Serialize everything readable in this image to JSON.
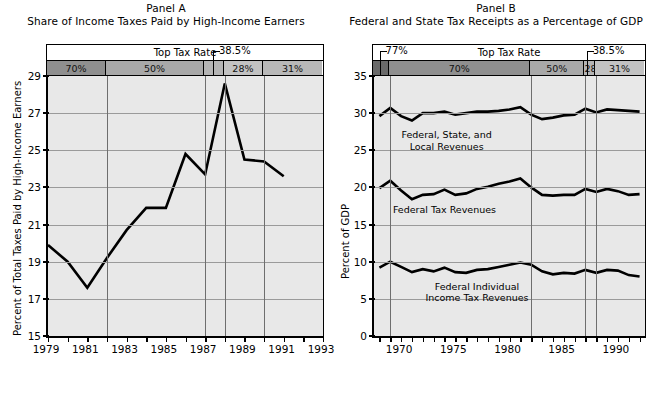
{
  "figure": {
    "panelA": {
      "title": "Panel A",
      "subtitle": "Share of Income Taxes Paid by High-Income Earners",
      "rate_header_label": "Top Tax Rate",
      "callout": "38.5%",
      "ylabel": "Percent of Total Taxes Paid by High-Income Earners",
      "bands": [
        {
          "label": "70%",
          "start": 1979,
          "end": 1982,
          "shade": "#8f8f8f"
        },
        {
          "label": "50%",
          "start": 1982,
          "end": 1987,
          "shade": "#a8a8a8"
        },
        {
          "label": "",
          "start": 1987,
          "end": 1988,
          "shade": "#b4b4b4"
        },
        {
          "label": "28%",
          "start": 1988,
          "end": 1990,
          "shade": "#c2c2c2"
        },
        {
          "label": "31%",
          "start": 1990,
          "end": 1993,
          "shade": "#b8b8b8"
        }
      ],
      "ytick_labels": [
        "29",
        "27",
        "25",
        "23",
        "21",
        "19",
        "17",
        "15"
      ],
      "xtick_labels": [
        "1979",
        "1981",
        "1983",
        "1985",
        "1987",
        "1989",
        "1991",
        "1993"
      ]
    },
    "panelB": {
      "title": "Panel B",
      "subtitle": "Federal and State Tax Receipts as a Percentage of GDP",
      "rate_header_label": "Top Tax Rate",
      "callout_left": "77%",
      "callout_right": "38.5%",
      "ylabel": "Percent of GDP",
      "bands": [
        {
          "label": "",
          "start": 1967.5,
          "end": 1969,
          "shade": "#6a6a6a"
        },
        {
          "label": "70%",
          "start": 1969,
          "end": 1982,
          "shade": "#8f8f8f"
        },
        {
          "label": "50%",
          "start": 1982,
          "end": 1987,
          "shade": "#a8a8a8"
        },
        {
          "label": "28%",
          "start": 1987,
          "end": 1988,
          "shade": "#b4b4b4"
        },
        {
          "label": "31%",
          "start": 1988,
          "end": 1992.5,
          "shade": "#c2c2c2"
        }
      ],
      "ytick_labels": [
        "35",
        "30",
        "25",
        "20",
        "15",
        "10",
        "5",
        "0"
      ],
      "xtick_labels": [
        "1970",
        "1975",
        "1980",
        "1985",
        "1990"
      ],
      "series_labels": [
        "Federal, State, and\nLocal Revenues",
        "Federal Tax Revenues",
        "Federal Individual\nIncome Tax Revenues"
      ]
    }
  },
  "chart_data": [
    {
      "type": "line",
      "title": "Panel A — Share of Income Taxes Paid by High-Income Earners",
      "xlabel": "",
      "ylabel": "Percent of Total Taxes Paid by High-Income Earners",
      "xlim": [
        1979,
        1993
      ],
      "ylim": [
        15,
        29
      ],
      "grid": true,
      "legend": "none",
      "x": [
        1979,
        1980,
        1981,
        1982,
        1983,
        1984,
        1985,
        1986,
        1987,
        1988,
        1989,
        1990,
        1991
      ],
      "series": [
        {
          "name": "Share of income taxes paid by high-income earners",
          "values": [
            19.9,
            19.0,
            17.6,
            19.2,
            20.7,
            21.9,
            21.9,
            24.8,
            23.7,
            28.6,
            24.5,
            24.4,
            23.6
          ]
        }
      ],
      "annotations": [
        {
          "text": "Top Tax Rate",
          "type": "band-header"
        },
        {
          "text": "70%",
          "type": "band",
          "span": [
            1979,
            1982
          ]
        },
        {
          "text": "50%",
          "type": "band",
          "span": [
            1982,
            1987
          ]
        },
        {
          "text": "38.5%",
          "type": "callout",
          "span": [
            1987,
            1988
          ]
        },
        {
          "text": "28%",
          "type": "band",
          "span": [
            1988,
            1990
          ]
        },
        {
          "text": "31%",
          "type": "band",
          "span": [
            1990,
            1993
          ]
        }
      ]
    },
    {
      "type": "line",
      "title": "Panel B — Federal and State Tax Receipts as a Percentage of GDP",
      "xlabel": "",
      "ylabel": "Percent of GDP",
      "xlim": [
        1967.5,
        1992.5
      ],
      "ylim": [
        0,
        35
      ],
      "grid": true,
      "legend": "inline-labels",
      "x": [
        1968,
        1969,
        1970,
        1971,
        1972,
        1973,
        1974,
        1975,
        1976,
        1977,
        1978,
        1979,
        1980,
        1981,
        1982,
        1983,
        1984,
        1985,
        1986,
        1987,
        1988,
        1989,
        1990,
        1991,
        1992
      ],
      "series": [
        {
          "name": "Federal, State, and Local Revenues",
          "values": [
            29.6,
            30.7,
            29.6,
            29.0,
            30.0,
            30.0,
            30.2,
            29.8,
            30.0,
            30.2,
            30.2,
            30.3,
            30.5,
            30.8,
            29.8,
            29.2,
            29.4,
            29.7,
            29.8,
            30.6,
            30.1,
            30.5,
            30.4,
            30.3,
            30.2
          ]
        },
        {
          "name": "Federal Tax Revenues",
          "values": [
            19.9,
            20.9,
            19.6,
            18.4,
            19.0,
            19.1,
            19.7,
            19.0,
            19.2,
            19.8,
            20.1,
            20.5,
            20.8,
            21.2,
            20.0,
            19.0,
            18.9,
            19.0,
            19.0,
            19.8,
            19.4,
            19.8,
            19.5,
            19.0,
            19.1
          ]
        },
        {
          "name": "Federal Individual Income Tax Revenues",
          "values": [
            9.2,
            10.0,
            9.3,
            8.6,
            9.0,
            8.7,
            9.2,
            8.6,
            8.5,
            8.9,
            9.0,
            9.3,
            9.6,
            9.9,
            9.6,
            8.7,
            8.3,
            8.5,
            8.4,
            8.9,
            8.5,
            8.9,
            8.8,
            8.2,
            8.0
          ]
        }
      ],
      "annotations": [
        {
          "text": "Top Tax Rate",
          "type": "band-header"
        },
        {
          "text": "77%",
          "type": "callout",
          "span": [
            1967.5,
            1969
          ]
        },
        {
          "text": "70%",
          "type": "band",
          "span": [
            1969,
            1982
          ]
        },
        {
          "text": "50%",
          "type": "band",
          "span": [
            1982,
            1987
          ]
        },
        {
          "text": "38.5%",
          "type": "callout",
          "span": [
            1987,
            1988
          ]
        },
        {
          "text": "28%",
          "type": "band",
          "span": [
            1987,
            1988
          ]
        },
        {
          "text": "31%",
          "type": "band",
          "span": [
            1988,
            1992.5
          ]
        }
      ]
    }
  ]
}
